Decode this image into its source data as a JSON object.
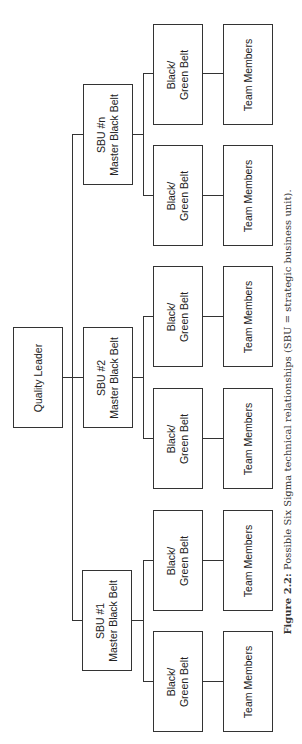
{
  "figure": {
    "caption_label": "Figure 2.2:",
    "caption_text": " Possible Six Sigma technical relationships (SBU = strategic business unit)."
  },
  "diagram": {
    "root": {
      "label": "Quality Leader"
    },
    "sbus": [
      {
        "line1": "SBU #1",
        "line2": "Master Black Belt",
        "belts": [
          {
            "line1": "Black/",
            "line2": "Green Belt",
            "team": "Team Members"
          },
          {
            "line1": "Black/",
            "line2": "Green Belt",
            "team": "Team Members"
          }
        ]
      },
      {
        "line1": "SBU #2",
        "line2": "Master Black Belt",
        "belts": [
          {
            "line1": "Black/",
            "line2": "Green Belt",
            "team": "Team Members"
          },
          {
            "line1": "Black/",
            "line2": "Green Belt",
            "team": "Team Members"
          }
        ]
      },
      {
        "line1": "SBU #n",
        "line2": "Master Black Belt",
        "belts": [
          {
            "line1": "Black/",
            "line2": "Green Belt",
            "team": "Team Members"
          },
          {
            "line1": "Black/",
            "line2": "Green Belt",
            "team": "Team Members"
          }
        ]
      }
    ]
  }
}
